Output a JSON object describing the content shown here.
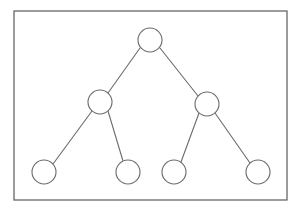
{
  "canvas": {
    "width": 300,
    "height": 212,
    "background_color": "#ffffff"
  },
  "diagram": {
    "type": "binary-tree",
    "title": "",
    "frame": {
      "name": "outer-border-rectangle",
      "x": 14,
      "y": 11,
      "width": 273,
      "height": 189,
      "stroke_color": "#5a5a5a",
      "stroke_width": 1.2,
      "fill_color": "#ffffff"
    },
    "style": {
      "node_radius": 12,
      "node_stroke_color": "#6b6b6b",
      "node_stroke_width": 1.1,
      "node_fill_color": "#ffffff",
      "edge_stroke_color": "#6b6b6b",
      "edge_stroke_width": 1.1
    },
    "levels": 3,
    "node_count": 7,
    "edge_count": 6,
    "nodes": [
      {
        "id": "root",
        "label": "",
        "cx": 150,
        "cy": 40,
        "r": 12,
        "level": 0,
        "role": "root"
      },
      {
        "id": "n-l",
        "label": "",
        "cx": 100,
        "cy": 102,
        "r": 12,
        "level": 1,
        "role": "internal"
      },
      {
        "id": "n-r",
        "label": "",
        "cx": 207,
        "cy": 104,
        "r": 12,
        "level": 1,
        "role": "internal"
      },
      {
        "id": "n-ll",
        "label": "",
        "cx": 44,
        "cy": 172,
        "r": 12,
        "level": 2,
        "role": "leaf"
      },
      {
        "id": "n-lr",
        "label": "",
        "cx": 128,
        "cy": 172,
        "r": 12,
        "level": 2,
        "role": "leaf"
      },
      {
        "id": "n-rl",
        "label": "",
        "cx": 174,
        "cy": 172,
        "r": 12,
        "level": 2,
        "role": "leaf"
      },
      {
        "id": "n-rr",
        "label": "",
        "cx": 258,
        "cy": 172,
        "r": 12,
        "level": 2,
        "role": "leaf"
      }
    ],
    "edges": [
      {
        "id": "e-root-l",
        "from": "root",
        "to": "n-l",
        "x1": 140,
        "y1": 48,
        "x2": 108,
        "y2": 93
      },
      {
        "id": "e-root-r",
        "from": "root",
        "to": "n-r",
        "x1": 160,
        "y1": 48,
        "x2": 198,
        "y2": 96
      },
      {
        "id": "e-l-ll",
        "from": "n-l",
        "to": "n-ll",
        "x1": 92,
        "y1": 111,
        "x2": 53,
        "y2": 164
      },
      {
        "id": "e-l-lr",
        "from": "n-l",
        "to": "n-lr",
        "x1": 108,
        "y1": 111,
        "x2": 123,
        "y2": 161
      },
      {
        "id": "e-r-rl",
        "from": "n-r",
        "to": "n-rl",
        "x1": 199,
        "y1": 113,
        "x2": 181,
        "y2": 162
      },
      {
        "id": "e-r-rr",
        "from": "n-r",
        "to": "n-rr",
        "x1": 215,
        "y1": 113,
        "x2": 250,
        "y2": 163
      }
    ]
  }
}
